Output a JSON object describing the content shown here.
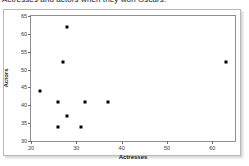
{
  "caption": {
    "text": "Actresses and actors when they won Oscars."
  },
  "chart_data": {
    "type": "scatter",
    "title": "",
    "xlabel": "Actresses",
    "ylabel": "Actors",
    "xlim": [
      20,
      65
    ],
    "ylim": [
      30,
      65
    ],
    "xticks": [
      20,
      30,
      40,
      50,
      60
    ],
    "yticks": [
      30,
      35,
      40,
      45,
      50,
      55,
      60,
      65
    ],
    "grid": false,
    "legend": "none",
    "marker": "filled-square",
    "marker_color": "#000000",
    "points": [
      {
        "x": 28,
        "y": 62
      },
      {
        "x": 27,
        "y": 52
      },
      {
        "x": 63,
        "y": 52
      },
      {
        "x": 22,
        "y": 44
      },
      {
        "x": 26,
        "y": 41
      },
      {
        "x": 32,
        "y": 41
      },
      {
        "x": 37,
        "y": 41
      },
      {
        "x": 28,
        "y": 37
      },
      {
        "x": 26,
        "y": 34
      },
      {
        "x": 31,
        "y": 34
      }
    ]
  }
}
